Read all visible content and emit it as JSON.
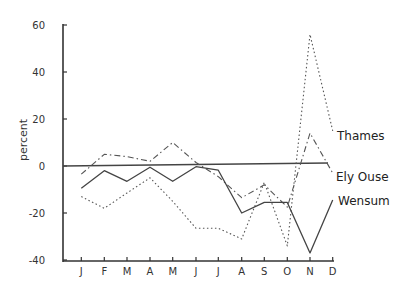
{
  "chart_data": {
    "type": "line",
    "title": "",
    "xlabel": "",
    "ylabel": "percent",
    "ylim": [
      -40,
      60
    ],
    "yticks": [
      60,
      40,
      20,
      0,
      -20,
      -40
    ],
    "grid": false,
    "legend_position": "inline-right",
    "categories": [
      "J",
      "F",
      "M",
      "A",
      "M",
      "J",
      "J",
      "A",
      "S",
      "O",
      "N",
      "D"
    ],
    "reference_line": {
      "value": 0,
      "style": "solid"
    },
    "series": [
      {
        "name": "Thames",
        "style": "dotted",
        "values": [
          -13,
          -18,
          -11.5,
          -5,
          -15,
          -26.5,
          -26.5,
          -31,
          -7,
          -34,
          56,
          15
        ]
      },
      {
        "name": "Ely Ouse",
        "style": "dash-dot",
        "values": [
          -3.5,
          5,
          4,
          2,
          10,
          1.5,
          -4.5,
          -13.5,
          -8,
          -17.5,
          14,
          -3
        ]
      },
      {
        "name": "Wensum",
        "style": "solid",
        "values": [
          -9.5,
          -2,
          -6.5,
          -0.5,
          -6.5,
          -0.3,
          -1.8,
          -20,
          -15.5,
          -15.5,
          -37,
          -14.5
        ]
      }
    ]
  }
}
